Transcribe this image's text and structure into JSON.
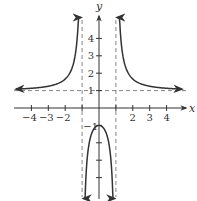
{
  "chart_data": {
    "type": "line",
    "title": "",
    "xlabel": "x",
    "ylabel": "y",
    "function": "f(x) = (x^2 + 1) / (x^2 - 1)",
    "xlim": [
      -5,
      5
    ],
    "ylim": [
      -5,
      5
    ],
    "grid": false,
    "x_ticks": [
      -4,
      -3,
      -2,
      -1,
      1,
      2,
      3,
      4
    ],
    "x_tick_labels": [
      "-4",
      "-3",
      "-2",
      "2",
      "3",
      "4"
    ],
    "x_tick_label_values": [
      -4,
      -3,
      -2,
      2,
      3,
      4
    ],
    "y_ticks": [
      -4,
      -3,
      -2,
      -1,
      1,
      2,
      3,
      4
    ],
    "y_tick_labels": [
      "4",
      "3",
      "2",
      "1",
      "-1"
    ],
    "y_tick_label_values": [
      4,
      3,
      2,
      1,
      -1
    ],
    "vertical_asymptotes": [
      -1,
      1
    ],
    "horizontal_asymptotes": [
      1
    ],
    "key_points": [
      {
        "x": 0,
        "y": -1
      }
    ],
    "series": [
      {
        "name": "left branch",
        "x_range": [
          -4.9,
          -1.07
        ]
      },
      {
        "name": "middle branch",
        "x_range": [
          -0.92,
          0.92
        ]
      },
      {
        "name": "right branch",
        "x_range": [
          1.07,
          4.9
        ]
      }
    ],
    "colors": {
      "curve": "#333333",
      "axis": "#333333",
      "asymptote": "#666666"
    }
  }
}
